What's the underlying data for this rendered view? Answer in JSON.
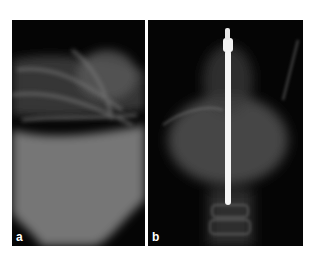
{
  "figure": {
    "panels": [
      {
        "label": "a",
        "description": "Radiograph showing chest/thoracic region with rib structures and dense lower region"
      },
      {
        "label": "b",
        "description": "Radiograph showing vertical metallic spinal rod along the spine"
      }
    ]
  }
}
